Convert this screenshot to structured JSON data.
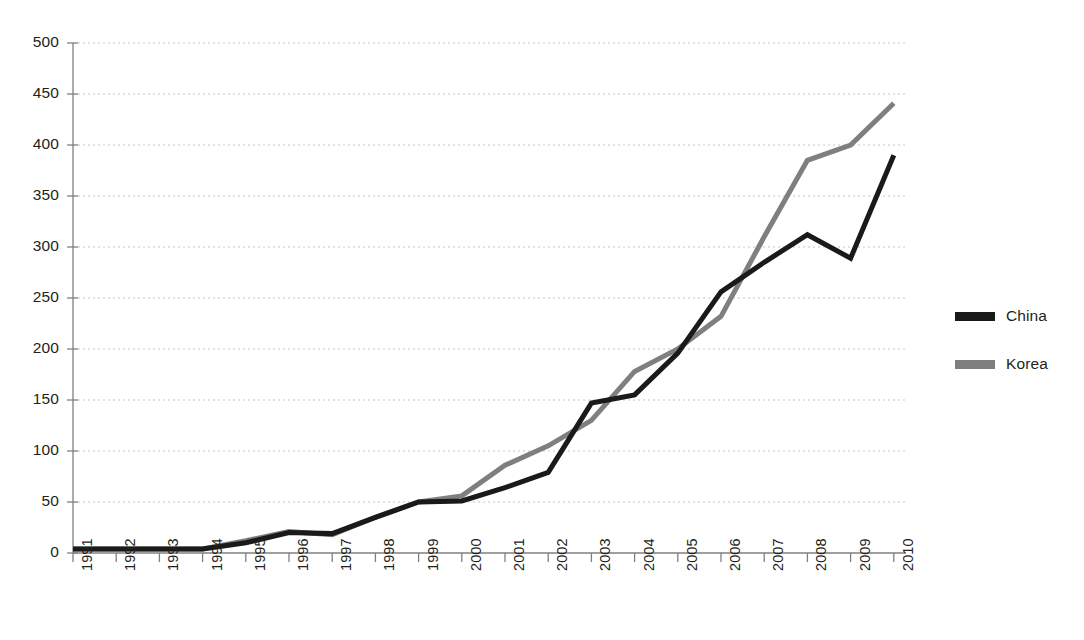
{
  "chart_data": {
    "type": "line",
    "title": "",
    "subtitle": "",
    "xlabel": "",
    "ylabel": "",
    "categories": [
      "1991",
      "1992",
      "1993",
      "1994",
      "1995",
      "1996",
      "1997",
      "1998",
      "1999",
      "2000",
      "2001",
      "2002",
      "2003",
      "2004",
      "2005",
      "2006",
      "2007",
      "2008",
      "2009",
      "2010"
    ],
    "series": [
      {
        "name": "China",
        "color": "#1a1a1a",
        "values": [
          4,
          4,
          4,
          4,
          10,
          20,
          19,
          35,
          50,
          51,
          64,
          79,
          147,
          155,
          196,
          256,
          285,
          312,
          289,
          390
        ]
      },
      {
        "name": "Korea",
        "color": "#7f7f7f",
        "values": [
          4,
          4,
          4,
          4,
          12,
          21,
          18,
          35,
          50,
          56,
          86,
          105,
          130,
          178,
          200,
          232,
          310,
          385,
          400,
          441
        ]
      }
    ],
    "ylim": [
      0,
      500
    ],
    "yticks": [
      0,
      50,
      100,
      150,
      200,
      250,
      300,
      350,
      400,
      450,
      500
    ],
    "ytick_labels": [
      "0",
      "50",
      "100",
      "150",
      "200",
      "250",
      "300",
      "350",
      "400",
      "450",
      "500"
    ],
    "grid": true,
    "grid_axis": "y",
    "grid_style": "dotted",
    "grid_color": "#b7c9dd",
    "legend_position": "right",
    "axis_color": "#808080",
    "line_width": 5,
    "xtick_rotation": -90
  },
  "legend": {
    "entries": [
      {
        "label": "China",
        "color": "#1a1a1a"
      },
      {
        "label": "Korea",
        "color": "#7f7f7f"
      }
    ]
  }
}
